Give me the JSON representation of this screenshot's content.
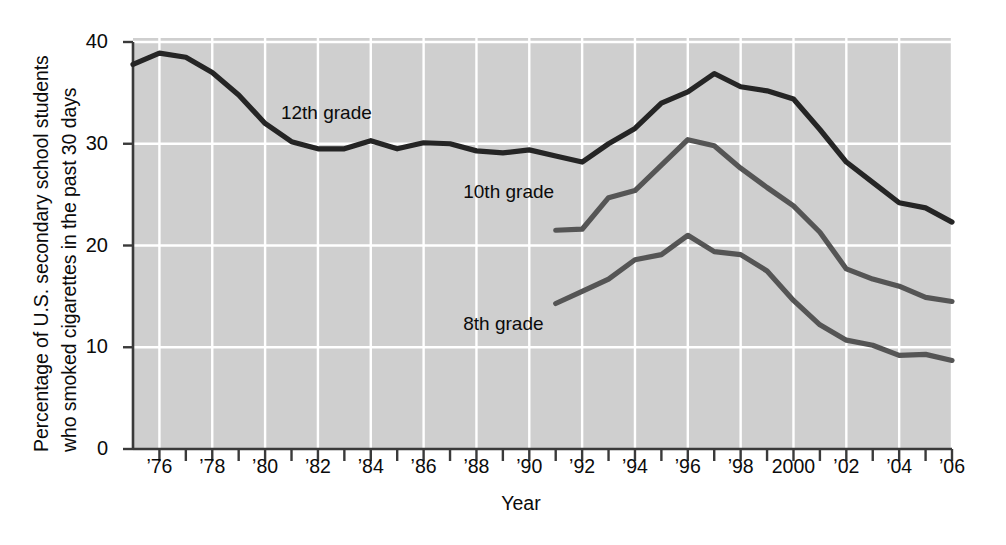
{
  "chart_data": {
    "type": "line",
    "title": "",
    "xlabel": "Year",
    "ylabel_line1": "Percentage of U.S. secondary school students",
    "ylabel_line2": "who smoked cigarettes in the past 30 days",
    "ylim": [
      0,
      40
    ],
    "xlim": [
      1975,
      2006
    ],
    "ytick_labels": [
      "0",
      "10",
      "20",
      "30",
      "40"
    ],
    "ytick_values": [
      0,
      10,
      20,
      30,
      40
    ],
    "xtick_values": [
      1975,
      1976,
      1977,
      1978,
      1979,
      1980,
      1981,
      1982,
      1983,
      1984,
      1985,
      1986,
      1987,
      1988,
      1989,
      1990,
      1991,
      1992,
      1993,
      1994,
      1995,
      1996,
      1997,
      1998,
      1999,
      2000,
      2001,
      2002,
      2003,
      2004,
      2005,
      2006
    ],
    "xtick_labeled": [
      {
        "value": 1976,
        "label": "’76"
      },
      {
        "value": 1978,
        "label": "’78"
      },
      {
        "value": 1980,
        "label": "’80"
      },
      {
        "value": 1982,
        "label": "’82"
      },
      {
        "value": 1984,
        "label": "’84"
      },
      {
        "value": 1986,
        "label": "’86"
      },
      {
        "value": 1988,
        "label": "’88"
      },
      {
        "value": 1990,
        "label": "’90"
      },
      {
        "value": 1992,
        "label": "’92"
      },
      {
        "value": 1994,
        "label": "’94"
      },
      {
        "value": 1996,
        "label": "’96"
      },
      {
        "value": 1998,
        "label": "’98"
      },
      {
        "value": 2000,
        "label": "2000"
      },
      {
        "value": 2002,
        "label": "’02"
      },
      {
        "value": 2004,
        "label": "’04"
      },
      {
        "value": 2006,
        "label": "’06"
      }
    ],
    "gridlines": {
      "horizontal": [
        10,
        20,
        30,
        40
      ],
      "vertical": [
        1976,
        1978,
        1980,
        1982,
        1984,
        1986,
        1988,
        1990,
        1992,
        1994,
        1996,
        1998,
        2000,
        2002,
        2004,
        2006
      ],
      "color": "#ffffff"
    },
    "plot_background": "#cfcfcf",
    "legend_position": "inline-annotations",
    "series": [
      {
        "name": "12th grade",
        "color": "#252525",
        "label_x": 1980.6,
        "label_y": 33.0,
        "x": [
          1975,
          1976,
          1977,
          1978,
          1979,
          1980,
          1981,
          1982,
          1983,
          1984,
          1985,
          1986,
          1987,
          1988,
          1989,
          1990,
          1991,
          1992,
          1993,
          1994,
          1995,
          1996,
          1997,
          1998,
          1999,
          2000,
          2001,
          2002,
          2003,
          2004,
          2005,
          2006
        ],
        "values": [
          37.8,
          38.9,
          38.5,
          37.0,
          34.8,
          32.0,
          30.2,
          29.5,
          29.5,
          30.3,
          29.5,
          30.1,
          30.0,
          29.3,
          29.1,
          29.4,
          28.8,
          28.2,
          30.0,
          31.5,
          34.0,
          35.1,
          36.9,
          35.6,
          35.2,
          34.4,
          31.4,
          28.2,
          26.2,
          24.2,
          23.7,
          22.3
        ]
      },
      {
        "name": "10th grade",
        "color": "#555555",
        "label_x": 1987.5,
        "label_y": 25.3,
        "x": [
          1991,
          1992,
          1993,
          1994,
          1995,
          1996,
          1997,
          1998,
          1999,
          2000,
          2001,
          2002,
          2003,
          2004,
          2005,
          2006
        ],
        "values": [
          21.5,
          21.6,
          24.7,
          25.4,
          27.9,
          30.4,
          29.8,
          27.6,
          25.7,
          23.9,
          21.3,
          17.7,
          16.7,
          16.0,
          14.9,
          14.5
        ]
      },
      {
        "name": "8th grade",
        "color": "#555555",
        "label_x": 1987.5,
        "label_y": 12.3,
        "x": [
          1991,
          1992,
          1993,
          1994,
          1995,
          1996,
          1997,
          1998,
          1999,
          2000,
          2001,
          2002,
          2003,
          2004,
          2005,
          2006
        ],
        "values": [
          14.3,
          15.5,
          16.7,
          18.6,
          19.1,
          21.0,
          19.4,
          19.1,
          17.5,
          14.6,
          12.2,
          10.7,
          10.2,
          9.2,
          9.3,
          8.7
        ]
      }
    ]
  }
}
